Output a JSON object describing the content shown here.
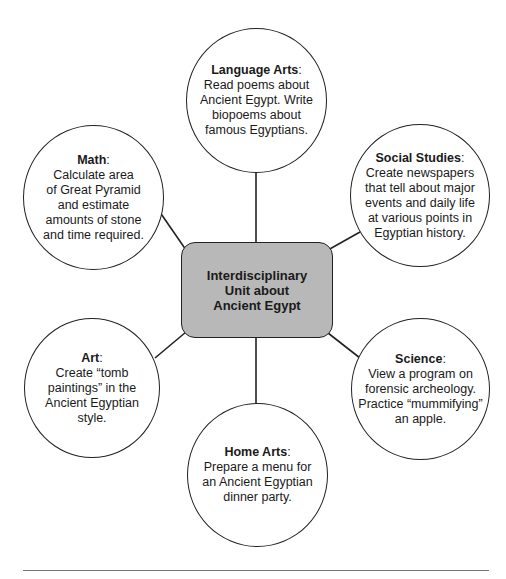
{
  "diagram": {
    "type": "concept-web",
    "center": {
      "label": "Interdisciplinary Unit about Ancient Egypt",
      "lines": [
        "Interdisciplinary",
        "Unit about",
        "Ancient Egypt"
      ],
      "fill": "#b8b8b8"
    },
    "nodes": [
      {
        "id": "language-arts",
        "title": "Language Arts",
        "sep": ":",
        "lines": [
          "Read poems about",
          "Ancient Egypt. Write",
          "biopoems about",
          "famous Egyptians."
        ]
      },
      {
        "id": "math",
        "title": "Math",
        "sep": ":",
        "lines": [
          "Calculate area",
          "of Great Pyramid",
          "and estimate",
          "amounts of stone",
          "and time required."
        ]
      },
      {
        "id": "social-studies",
        "title": "Social Studies",
        "sep": ":",
        "lines": [
          "Create newspapers",
          "that tell about major",
          "events and daily life",
          "at various points in",
          "Egyptian history."
        ]
      },
      {
        "id": "art",
        "title": "Art",
        "sep": ":",
        "lines": [
          "Create “tomb",
          "paintings” in the",
          "Ancient Egyptian",
          "style."
        ]
      },
      {
        "id": "science",
        "title": "Science",
        "sep": ":",
        "lines": [
          "View a program on",
          "forensic archeology.",
          "Practice “mummifying”",
          "an apple."
        ]
      },
      {
        "id": "home-arts",
        "title": "Home Arts",
        "sep": ":",
        "lines": [
          "Prepare a menu for",
          "an Ancient Egyptian",
          "dinner party."
        ]
      }
    ]
  }
}
